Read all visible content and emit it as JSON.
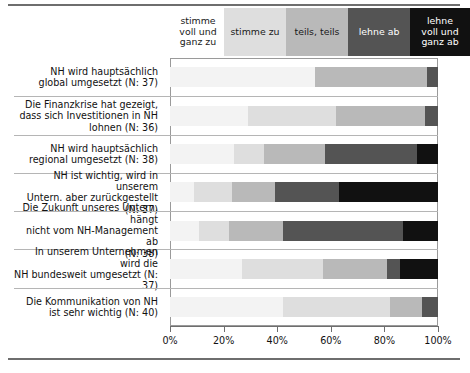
{
  "chart_data": {
    "type": "bar",
    "orientation": "horizontal",
    "stacked": true,
    "normalized": true,
    "title": "",
    "subtitle": "",
    "xlabel": "",
    "ylabel": "",
    "xlim": [
      0,
      100
    ],
    "xticks": [
      0,
      20,
      40,
      60,
      80,
      100
    ],
    "xtick_labels": [
      "0%",
      "20%",
      "40%",
      "60%",
      "80%",
      "100%"
    ],
    "grid": false,
    "legend_position": "top",
    "legend": [
      {
        "label": "stimme\nvoll und\nganz zu",
        "color": "#f3f3f3"
      },
      {
        "label": "stimme zu",
        "color": "#dedede"
      },
      {
        "label": "teils, teils",
        "color": "#b9b9b9"
      },
      {
        "label": "lehne ab",
        "color": "#545454"
      },
      {
        "label": "lehne\nvoll und\nganz ab",
        "color": "#111111"
      }
    ],
    "legend_labels_flat": [
      "stimme voll und ganz zu",
      "stimme zu",
      "teils, teils",
      "lehne ab",
      "lehne voll und ganz ab"
    ],
    "categories": [
      "NH wird hauptsächlich global umgesetzt (N: 37)",
      "Die Finanzkrise hat gezeigt, dass sich Investitionen in NH lohnen (N: 36)",
      "NH wird hauptsächlich regional umgesetzt (N: 38)",
      "NH ist wichtig, wird in unserem Untern. aber zurückgestellt (N: 37)",
      "Die Zukunft unseres Untern. hängt nicht vom NH-Management ab (N: 38)",
      "In unserem Unternehmen wird die NH bundesweit umgesetzt (N: 37)",
      "Die Kommunikation von NH ist sehr wichtig (N: 40)"
    ],
    "series": [
      {
        "name": "stimme voll und ganz zu",
        "color": "#f3f3f3",
        "values": [
          54,
          29,
          24,
          9,
          11,
          27,
          42
        ]
      },
      {
        "name": "stimme zu",
        "color": "#dedede",
        "values": [
          0,
          33,
          11,
          14,
          11,
          30,
          40
        ]
      },
      {
        "name": "teils, teils",
        "color": "#b9b9b9",
        "values": [
          42,
          33,
          23,
          16,
          20,
          24,
          12
        ]
      },
      {
        "name": "lehne ab",
        "color": "#545454",
        "values": [
          4,
          5,
          34,
          24,
          45,
          5,
          6
        ]
      },
      {
        "name": "lehne voll und ganz ab",
        "color": "#111111",
        "values": [
          0,
          0,
          8,
          37,
          13,
          14,
          0
        ]
      }
    ]
  },
  "rows": [
    {
      "label": "NH wird hauptsächlich\nglobal umgesetzt (N: 37)",
      "line1": "NH wird hauptsächlich",
      "line2": "global umgesetzt (N: 37)",
      "line3": ""
    },
    {
      "label": "Die Finanzkrise hat gezeigt,\ndass sich Investitionen in NH\nlohnen (N: 36)",
      "line1": "Die Finanzkrise hat gezeigt,",
      "line2": "dass sich Investitionen in NH",
      "line3": "lohnen (N: 36)"
    },
    {
      "label": "NH wird hauptsächlich\nregional umgesetzt (N: 38)",
      "line1": "NH wird hauptsächlich",
      "line2": "regional umgesetzt (N: 38)",
      "line3": ""
    },
    {
      "label": "NH ist wichtig, wird in unserem\nUntern. aber zurückgestellt (N: 37)",
      "line1": "NH ist wichtig, wird in unserem",
      "line2": "Untern. aber zurückgestellt (N: 37)",
      "line3": ""
    },
    {
      "label": "Die Zukunft unseres Untern. hängt\nnicht vom NH-Management ab\n(N: 38)",
      "line1": "Die Zukunft unseres Untern. hängt",
      "line2": "nicht vom NH-Management ab",
      "line3": "(N: 38)"
    },
    {
      "label": "In unserem Unternehmen wird die\nNH bundesweit umgesetzt (N: 37)",
      "line1": "In unserem Unternehmen wird die",
      "line2": "NH bundesweit umgesetzt (N: 37)",
      "line3": ""
    },
    {
      "label": "Die Kommunikation von NH\nist sehr wichtig (N: 40)",
      "line1": "Die Kommunikation von NH",
      "line2": "ist sehr wichtig (N: 40)",
      "line3": ""
    }
  ],
  "legend_cells": [
    {
      "text": "stimme\nvoll und\nganz zu",
      "l1": "stimme",
      "l2": "voll und",
      "l3": "ganz zu"
    },
    {
      "text": "stimme zu",
      "l1": "stimme zu",
      "l2": "",
      "l3": ""
    },
    {
      "text": "teils, teils",
      "l1": "teils, teils",
      "l2": "",
      "l3": ""
    },
    {
      "text": "lehne ab",
      "l1": "lehne ab",
      "l2": "",
      "l3": ""
    },
    {
      "text": "lehne\nvoll und\nganz ab",
      "l1": "lehne",
      "l2": "voll und",
      "l3": "ganz ab"
    }
  ],
  "axis": {
    "labels": [
      "0%",
      "20%",
      "40%",
      "60%",
      "80%",
      "100%"
    ]
  },
  "colors": {
    "seg0": "#f3f3f3",
    "seg1": "#dedede",
    "seg2": "#b9b9b9",
    "seg3": "#545454",
    "seg4": "#111111",
    "rule": "#6e6e6e",
    "frame": "#9a9a9a"
  }
}
